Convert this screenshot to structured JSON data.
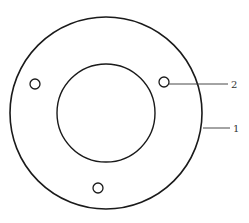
{
  "figure": {
    "type": "annular disc with mounting holes",
    "parts": [
      {
        "id": "outer-disc",
        "callout": "1"
      },
      {
        "id": "mounting-hole",
        "callout": "2"
      }
    ],
    "hole_count": 3,
    "colors": {
      "line": "#1a1a1a",
      "background": "#ffffff"
    }
  },
  "callouts": {
    "one": "1",
    "two": "2"
  }
}
